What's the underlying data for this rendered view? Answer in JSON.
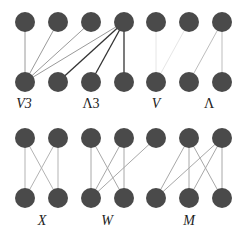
{
  "diagram": {
    "node_color": "#4a4a4a",
    "node_radius": 10,
    "columns_x": [
      25,
      58,
      91,
      124,
      156,
      189,
      222
    ],
    "panels": [
      {
        "id": "top",
        "top_y": 22,
        "bottom_y": 82,
        "top_nodes": [
          25,
          58,
          91,
          124,
          156,
          189,
          222
        ],
        "bottom_nodes": [
          25,
          58,
          91,
          124,
          156,
          189,
          222
        ],
        "groups": [
          {
            "name": "V3",
            "label": "V3",
            "label_x": 24,
            "label_y": 108,
            "italic_part": "V",
            "edge_color": "#9a9a9a",
            "edges": [
              [
                25,
                25
              ],
              [
                58,
                25
              ],
              [
                91,
                25
              ],
              [
                124,
                25
              ]
            ]
          },
          {
            "name": "Lambda3",
            "label": "Λ3",
            "label_x": 91,
            "label_y": 108,
            "edge_color": "#333333",
            "edges": [
              [
                124,
                58
              ],
              [
                124,
                91
              ],
              [
                124,
                124
              ]
            ]
          },
          {
            "name": "V",
            "label": "V",
            "label_x": 156,
            "label_y": 108,
            "edge_color": "#e6e6e6",
            "edges": [
              [
                156,
                156
              ],
              [
                189,
                156
              ]
            ]
          },
          {
            "name": "Lambda",
            "label": "Λ",
            "label_x": 209,
            "label_y": 108,
            "edge_color": "#bdbdbd",
            "edges": [
              [
                222,
                189
              ],
              [
                222,
                222
              ]
            ]
          }
        ]
      },
      {
        "id": "bottom",
        "top_y": 138,
        "bottom_y": 198,
        "top_nodes": [
          25,
          58,
          91,
          124,
          156,
          189,
          222
        ],
        "bottom_nodes": [
          25,
          58,
          91,
          124,
          156,
          189,
          222
        ],
        "groups": [
          {
            "name": "X",
            "label": "X",
            "label_x": 42,
            "label_y": 225,
            "edge_color": "#b3b3b3",
            "edges": [
              [
                25,
                25
              ],
              [
                25,
                58
              ],
              [
                58,
                25
              ],
              [
                58,
                58
              ]
            ]
          },
          {
            "name": "W",
            "label": "W",
            "label_x": 107,
            "label_y": 225,
            "edge_color": "#a8a8a8",
            "edges": [
              [
                91,
                91
              ],
              [
                91,
                124
              ],
              [
                124,
                91
              ],
              [
                124,
                124
              ],
              [
                156,
                91
              ]
            ]
          },
          {
            "name": "M",
            "label": "M",
            "label_x": 189,
            "label_y": 225,
            "edge_color": "#a8a8a8",
            "edges": [
              [
                189,
                156
              ],
              [
                189,
                189
              ],
              [
                189,
                222
              ],
              [
                222,
                156
              ],
              [
                222,
                189
              ],
              [
                222,
                222
              ]
            ]
          }
        ]
      }
    ]
  }
}
